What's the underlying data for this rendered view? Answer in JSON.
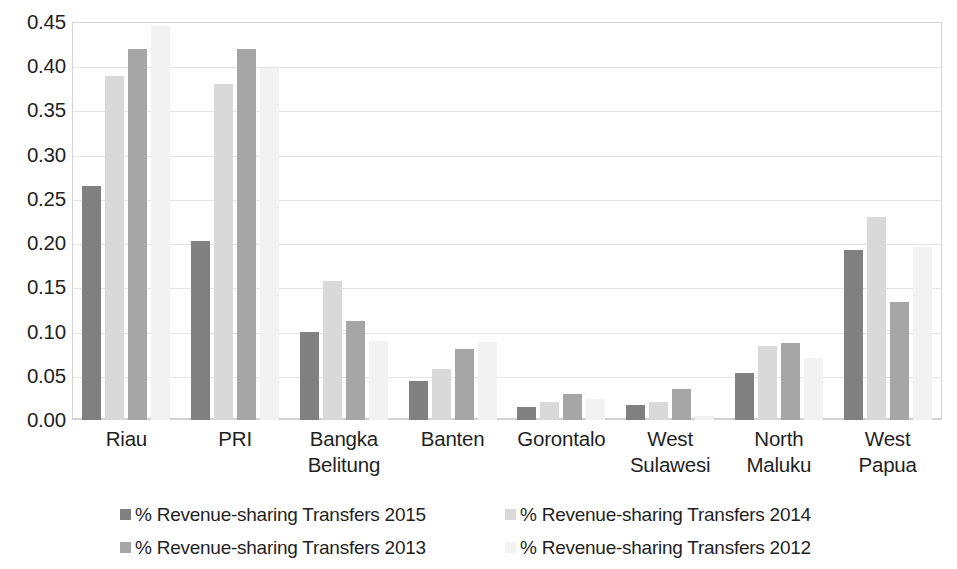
{
  "chart_data": {
    "type": "bar",
    "title": "",
    "xlabel": "",
    "ylabel": "",
    "ylim": [
      0,
      0.45
    ],
    "ytick_labels": [
      "0.45",
      "0.40",
      "0.35",
      "0.30",
      "0.25",
      "0.20",
      "0.15",
      "0.10",
      "0.05",
      "0.00"
    ],
    "ytick_values": [
      0.45,
      0.4,
      0.35,
      0.3,
      0.25,
      0.2,
      0.15,
      0.1,
      0.05,
      0.0
    ],
    "grid": true,
    "legend_position": "bottom",
    "categories": [
      [
        "Riau"
      ],
      [
        "PRI"
      ],
      [
        "Bangka",
        "Belitung"
      ],
      [
        "Banten"
      ],
      [
        "Gorontalo"
      ],
      [
        "West",
        "Sulawesi"
      ],
      [
        "North",
        "Maluku"
      ],
      [
        "West",
        "Papua"
      ]
    ],
    "series": [
      {
        "name": "% Revenue-sharing Transfers 2015",
        "color": "#808080",
        "values": [
          0.265,
          0.202,
          0.1,
          0.044,
          0.015,
          0.017,
          0.053,
          0.192
        ]
      },
      {
        "name": "% Revenue-sharing Transfers 2014",
        "color": "#d9d9d9",
        "values": [
          0.389,
          0.38,
          0.157,
          0.058,
          0.02,
          0.02,
          0.084,
          0.229
        ]
      },
      {
        "name": "% Revenue-sharing Transfers 2013",
        "color": "#a6a6a6",
        "values": [
          0.42,
          0.419,
          0.112,
          0.08,
          0.029,
          0.035,
          0.087,
          0.134
        ]
      },
      {
        "name": "% Revenue-sharing Transfers 2012",
        "color": "#f2f2f2",
        "values": [
          0.446,
          0.398,
          0.089,
          0.088,
          0.024,
          0.004,
          0.07,
          0.196
        ]
      }
    ]
  }
}
